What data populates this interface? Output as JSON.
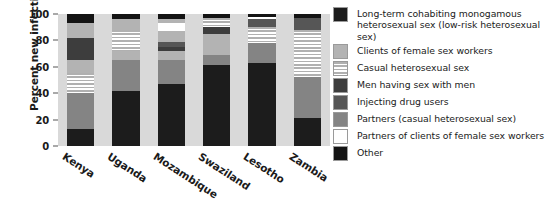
{
  "chart_data": {
    "type": "bar",
    "subtype": "stacked-bar-100-percent",
    "title": "",
    "xlabel": "",
    "ylabel": "Percent new infections",
    "ylim": [
      0,
      100
    ],
    "yticks": [
      0,
      20,
      40,
      60,
      80,
      100
    ],
    "grid": false,
    "legend_position": "right",
    "categories": [
      "Kenya",
      "Uganda",
      "Mozambique",
      "Swaziland",
      "Lesotho",
      "Zambia"
    ],
    "series": [
      {
        "name": "Long-term cohabiting monogamous heterosexual sex (low-risk heterosexual sex)",
        "color": "#1c1c1c",
        "values": [
          13,
          42,
          47,
          61,
          63,
          21
        ]
      },
      {
        "name": "Clients of female sex workers",
        "color": "#b3b3b3",
        "values": [
          27,
          23,
          18,
          8,
          15,
          31
        ]
      },
      {
        "name": "Casual heterosexual sex",
        "color": "#b0b0b0",
        "values": [
          15,
          0,
          0,
          0,
          0,
          36
        ]
      },
      {
        "name": "Men having sex with men",
        "color": "#3d3d3d",
        "values": [
          0,
          7,
          7,
          16,
          0,
          0
        ]
      },
      {
        "name": "Injecting drug users",
        "color": "#565656",
        "values": [
          17,
          16,
          3,
          5,
          12,
          9
        ]
      },
      {
        "name": "Partners (casual heterosexual sex)",
        "color": "#848484",
        "values": [
          11,
          8,
          4,
          7,
          6,
          0
        ]
      },
      {
        "name": "Partners of clients of female sex workers",
        "color": "#ffffff",
        "values": [
          0,
          0,
          14,
          0,
          2,
          0
        ]
      },
      {
        "name": "Other",
        "color": "#141414",
        "values": [
          17,
          4,
          7,
          3,
          2,
          3
        ]
      }
    ],
    "stacks": {
      "Kenya": [
        {
          "key": "longterm",
          "from": 0,
          "to": 13
        },
        {
          "key": "partners",
          "from": 13,
          "to": 40
        },
        {
          "key": "casual",
          "from": 40,
          "to": 55
        },
        {
          "key": "clients",
          "from": 55,
          "to": 65
        },
        {
          "key": "msm",
          "from": 65,
          "to": 82
        },
        {
          "key": "clients2",
          "from": 82,
          "to": 93
        },
        {
          "key": "other",
          "from": 93,
          "to": 100
        }
      ],
      "Uganda": [
        {
          "key": "longterm",
          "from": 0,
          "to": 42
        },
        {
          "key": "partners",
          "from": 42,
          "to": 65
        },
        {
          "key": "clients",
          "from": 65,
          "to": 72
        },
        {
          "key": "casual",
          "from": 72,
          "to": 88
        },
        {
          "key": "clients2",
          "from": 88,
          "to": 96
        },
        {
          "key": "other",
          "from": 96,
          "to": 100
        }
      ],
      "Mozambique": [
        {
          "key": "longterm",
          "from": 0,
          "to": 47
        },
        {
          "key": "partners",
          "from": 47,
          "to": 65
        },
        {
          "key": "clients",
          "from": 65,
          "to": 72
        },
        {
          "key": "msm",
          "from": 72,
          "to": 75
        },
        {
          "key": "idu",
          "from": 75,
          "to": 79
        },
        {
          "key": "clients2",
          "from": 79,
          "to": 87
        },
        {
          "key": "pclients",
          "from": 87,
          "to": 93
        },
        {
          "key": "clients3",
          "from": 93,
          "to": 96
        },
        {
          "key": "other",
          "from": 96,
          "to": 100
        }
      ],
      "Swaziland": [
        {
          "key": "longterm",
          "from": 0,
          "to": 61
        },
        {
          "key": "partners",
          "from": 61,
          "to": 69
        },
        {
          "key": "clients",
          "from": 69,
          "to": 85
        },
        {
          "key": "msm",
          "from": 85,
          "to": 90
        },
        {
          "key": "casual",
          "from": 90,
          "to": 97
        },
        {
          "key": "other",
          "from": 97,
          "to": 100
        }
      ],
      "Lesotho": [
        {
          "key": "longterm",
          "from": 0,
          "to": 63
        },
        {
          "key": "partners",
          "from": 63,
          "to": 78
        },
        {
          "key": "casual",
          "from": 78,
          "to": 90
        },
        {
          "key": "idu",
          "from": 90,
          "to": 96
        },
        {
          "key": "pclients",
          "from": 96,
          "to": 98
        },
        {
          "key": "other",
          "from": 98,
          "to": 100
        }
      ],
      "Zambia": [
        {
          "key": "longterm",
          "from": 0,
          "to": 21
        },
        {
          "key": "partners",
          "from": 21,
          "to": 52
        },
        {
          "key": "casual",
          "from": 52,
          "to": 88
        },
        {
          "key": "idu",
          "from": 88,
          "to": 97
        },
        {
          "key": "other",
          "from": 97,
          "to": 100
        }
      ]
    }
  },
  "axis": {
    "ylabel": "Percent new infections",
    "ytick_labels": [
      "0",
      "20",
      "40",
      "60",
      "80",
      "100"
    ],
    "xtick_labels": [
      "Kenya",
      "Uganda",
      "Mozambique",
      "Swaziland",
      "Lesotho",
      "Zambia"
    ]
  },
  "legend": {
    "items": [
      {
        "fill": "f-longterm",
        "line1": "Long-term cohabiting monogamous",
        "line2": "heterosexual sex (low-risk heterosexual sex)"
      },
      {
        "fill": "f-clients",
        "line1": "Clients of female sex workers",
        "line2": ""
      },
      {
        "fill": "f-casual",
        "line1": "Casual heterosexual sex",
        "line2": ""
      },
      {
        "fill": "f-msm",
        "line1": "Men having sex with men",
        "line2": ""
      },
      {
        "fill": "f-idu",
        "line1": "Injecting drug users",
        "line2": ""
      },
      {
        "fill": "f-partners",
        "line1": "Partners (casual heterosexual sex)",
        "line2": ""
      },
      {
        "fill": "f-pclients",
        "line1": "Partners of clients of female sex workers",
        "line2": ""
      },
      {
        "fill": "f-other",
        "line1": "Other",
        "line2": ""
      }
    ]
  }
}
